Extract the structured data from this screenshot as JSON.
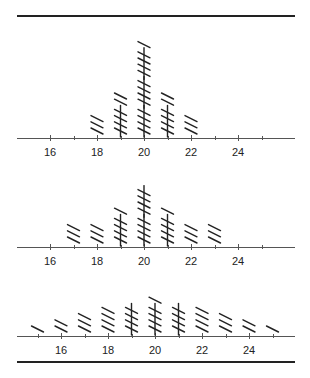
{
  "chart_data": [
    {
      "type": "tally",
      "title": "",
      "xlabel": "",
      "ylabel": "",
      "x": [
        18,
        19,
        20,
        21,
        22
      ],
      "counts": [
        3,
        7,
        16,
        7,
        3
      ],
      "axis": {
        "min": 15,
        "max": 25,
        "major_ticks": [
          16,
          18,
          20,
          22,
          24
        ],
        "minor_ticks": [
          17,
          19,
          21,
          23,
          25
        ]
      }
    },
    {
      "type": "tally",
      "title": "",
      "xlabel": "",
      "ylabel": "",
      "x": [
        17,
        18,
        19,
        20,
        21,
        22,
        23
      ],
      "counts": [
        3,
        3,
        6,
        10,
        6,
        3,
        3
      ],
      "axis": {
        "min": 15,
        "max": 25,
        "major_ticks": [
          16,
          18,
          20,
          22,
          24
        ],
        "minor_ticks": [
          17,
          19,
          21,
          23,
          25
        ]
      }
    },
    {
      "type": "tally",
      "title": "",
      "xlabel": "",
      "ylabel": "",
      "x": [
        15,
        16,
        17,
        18,
        19,
        20,
        21,
        22,
        23,
        24,
        25
      ],
      "counts": [
        1,
        2,
        3,
        4,
        5,
        6,
        5,
        4,
        3,
        2,
        1
      ],
      "axis": {
        "min": 15,
        "max": 25,
        "major_ticks": [
          16,
          18,
          20,
          22,
          24
        ],
        "minor_ticks": [
          15,
          17,
          19,
          21,
          23,
          25
        ]
      }
    }
  ],
  "panels": [
    {
      "axis_y": 138,
      "x16": 50,
      "labels": [
        "16",
        "18",
        "20",
        "22",
        "24"
      ]
    },
    {
      "axis_y": 247,
      "x16": 50,
      "labels": [
        "16",
        "18",
        "20",
        "22",
        "24"
      ]
    },
    {
      "axis_y": 336,
      "x16": 61,
      "labels": [
        "16",
        "18",
        "20",
        "22",
        "24"
      ]
    }
  ],
  "style": {
    "ink": "#222222",
    "axis": "#555555"
  }
}
